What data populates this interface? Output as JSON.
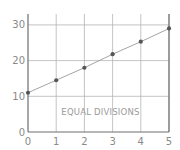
{
  "chart_data": {
    "type": "line",
    "title": "",
    "xlabel": "",
    "ylabel": "",
    "x": [
      0,
      1,
      2,
      3,
      4,
      5
    ],
    "series": [
      {
        "name": "",
        "values": [
          11,
          14.5,
          18,
          21.8,
          25.3,
          29
        ]
      }
    ],
    "x_ticks": [
      "0",
      "1",
      "2",
      "3",
      "4",
      "5"
    ],
    "y_ticks": [
      "0",
      "10",
      "20",
      "30"
    ],
    "xlim": [
      0,
      5
    ],
    "ylim": [
      0,
      33
    ],
    "grid": true,
    "legend": null,
    "annotations": [
      {
        "text": "EQUAL DIVISIONS",
        "x": 2.5,
        "y": 5.5
      }
    ],
    "colors": {
      "line": "#9a9a9a",
      "marker": "#555555",
      "grid": "#b5b5b5",
      "axis": "#6e6e6e"
    }
  }
}
